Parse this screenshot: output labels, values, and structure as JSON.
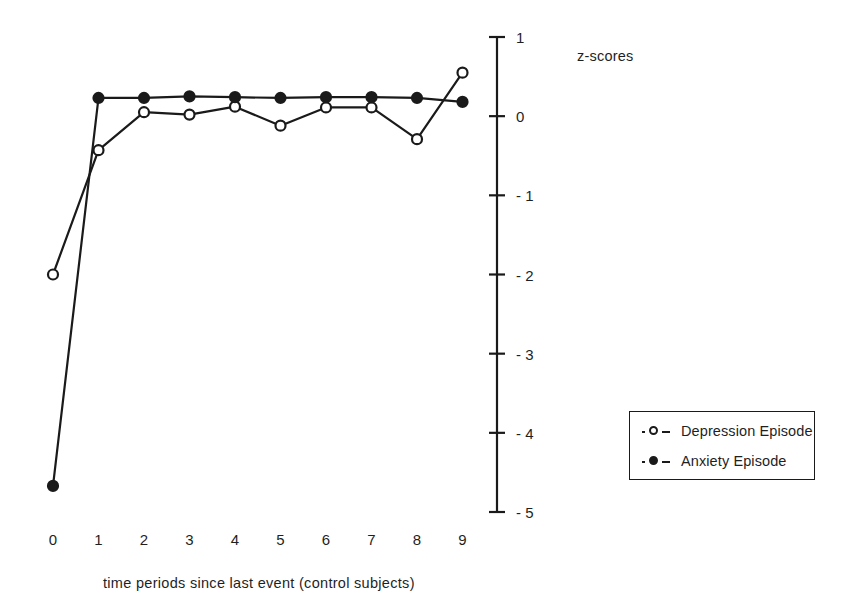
{
  "chart_data": {
    "type": "line",
    "title": "",
    "xlabel": "time periods since last event (control subjects)",
    "ylabel": "z-scores",
    "x": [
      0,
      1,
      2,
      3,
      4,
      5,
      6,
      7,
      8,
      9
    ],
    "xticklabels": [
      "0",
      "1",
      "2",
      "3",
      "4",
      "5",
      "6",
      "7",
      "8",
      "9"
    ],
    "yticks": [
      1,
      0,
      -1,
      -2,
      -3,
      -4,
      -5
    ],
    "yticklabels": [
      "1",
      "0",
      "- 1",
      "- 2",
      "- 3",
      "- 4",
      "- 5"
    ],
    "ylim": [
      -5,
      1
    ],
    "xlim": [
      -0.35,
      9.5
    ],
    "grid": false,
    "axis_position": "y-axis on right side, no x-axis line drawn",
    "legend_position": "lower right, outside plot area, boxed",
    "series": [
      {
        "name": "Depression Episode",
        "marker": "open-circle",
        "color": "#1a1a1a",
        "values": [
          -2.0,
          -0.43,
          0.05,
          0.02,
          0.12,
          -0.12,
          0.11,
          0.11,
          -0.29,
          0.55
        ]
      },
      {
        "name": "Anxiety Episode",
        "marker": "filled-circle",
        "color": "#1a1a1a",
        "values": [
          -4.67,
          0.23,
          0.23,
          0.25,
          0.24,
          0.23,
          0.24,
          0.24,
          0.23,
          0.18
        ]
      }
    ]
  },
  "labels": {
    "ylabel_text": "z-scores",
    "xlabel_text": "time periods since last event (control subjects)"
  },
  "legend": {
    "items": [
      {
        "label": "Depression Episode",
        "marker": "open-circle-icon"
      },
      {
        "label": "Anxiety Episode",
        "marker": "filled-circle-icon"
      }
    ]
  }
}
